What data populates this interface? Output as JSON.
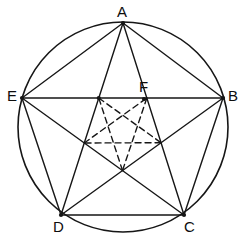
{
  "figure": {
    "background_color": "#ffffff",
    "stroke_color": "#161616",
    "label_color": "#0d0d0d",
    "circle": {
      "center_x": 123,
      "center_y": 127,
      "radius": 105,
      "stroke_width": 1.6
    },
    "solid_stroke_width": 1.4,
    "dashed_stroke_width": 1.4,
    "dash_pattern": "6,4",
    "vertices": [
      {
        "id": "A",
        "label": "A",
        "x": 123,
        "y": 23,
        "label_x": 117,
        "label_y": 4,
        "dot": true
      },
      {
        "id": "B",
        "label": "B",
        "x": 223,
        "y": 98,
        "label_x": 228,
        "label_y": 88,
        "dot": true
      },
      {
        "id": "C",
        "label": "C",
        "x": 184,
        "y": 215,
        "label_x": 184,
        "label_y": 219,
        "dot": true
      },
      {
        "id": "D",
        "label": "D",
        "x": 61,
        "y": 215,
        "label_x": 53,
        "label_y": 219,
        "dot": true
      },
      {
        "id": "E",
        "label": "E",
        "x": 22,
        "y": 98,
        "label_x": 7,
        "label_y": 88,
        "dot": true
      }
    ],
    "marked_points": [
      {
        "id": "F",
        "label": "F",
        "x": 144,
        "y": 99,
        "label_x": 139,
        "label_y": 79,
        "dot": true
      }
    ],
    "polygon_edges": [
      {
        "from": "A",
        "to": "B",
        "style": "solid"
      },
      {
        "from": "B",
        "to": "C",
        "style": "solid"
      },
      {
        "from": "C",
        "to": "D",
        "style": "solid"
      },
      {
        "from": "D",
        "to": "E",
        "style": "solid"
      },
      {
        "from": "E",
        "to": "A",
        "style": "solid"
      }
    ],
    "diagonal_edges": [
      {
        "from": "A",
        "to": "C",
        "style": "solid"
      },
      {
        "from": "A",
        "to": "D",
        "style": "solid"
      },
      {
        "from": "B",
        "to": "D",
        "style": "solid"
      },
      {
        "from": "B",
        "to": "E",
        "style": "solid"
      },
      {
        "from": "C",
        "to": "E",
        "style": "solid"
      }
    ],
    "inner_pentagram_style": "dashed",
    "inner_pentagram_note": "Dashed five-pointed star joining the five intersection points of the outer diagonals"
  },
  "caption": {
    "partial_text": ""
  }
}
